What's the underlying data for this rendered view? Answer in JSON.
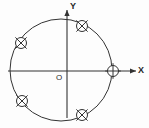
{
  "figure": {
    "type": "geometry-diagram",
    "background_color": "#fdfdfd",
    "stroke_color": "#333333",
    "label_color": "#262626"
  },
  "axes": {
    "origin_label": "O",
    "x_axis": {
      "label": "X",
      "name": "x-axis",
      "from": [
        8,
        71
      ],
      "to": [
        136,
        71
      ],
      "arrow": "right"
    },
    "y_axis": {
      "label": "Y",
      "name": "y-axis",
      "from": [
        67,
        118
      ],
      "to": [
        67,
        10
      ],
      "arrow": "up"
    },
    "origin_point": [
      67,
      71
    ]
  },
  "circle": {
    "name": "main-circle",
    "center": [
      61,
      70
    ],
    "radius": 51,
    "stroke_width": 1
  },
  "markers": [
    {
      "id": "marker-x-axis",
      "name": "circled-plus-marker",
      "glyph": "circle-with-cross",
      "position": [
        113,
        71
      ],
      "radius": 5.5,
      "on_axis": "x",
      "angle_deg": 0
    },
    {
      "id": "marker-upper-right",
      "name": "circled-cross-marker-upper-right",
      "glyph": "circle-with-x",
      "position": [
        82,
        26
      ],
      "radius": 5.5,
      "angle_deg": 61
    },
    {
      "id": "marker-upper-left",
      "name": "circled-cross-marker-upper-left",
      "glyph": "circle-with-x",
      "position": [
        21,
        43
      ],
      "radius": 5.5,
      "angle_deg": 148
    },
    {
      "id": "marker-lower-left",
      "name": "circled-cross-marker-lower-left",
      "glyph": "circle-with-x",
      "position": [
        22,
        101
      ],
      "radius": 5.5,
      "angle_deg": 220
    },
    {
      "id": "marker-lower-right",
      "name": "circled-cross-marker-lower-right",
      "glyph": "circle-with-x",
      "position": [
        82,
        115
      ],
      "radius": 5.5,
      "angle_deg": 297
    }
  ],
  "chart_data": {
    "type": "scatter",
    "xlabel": "X",
    "ylabel": "Y",
    "grid": false,
    "legend": null,
    "annotations": [
      "O",
      "X",
      "Y"
    ],
    "categories": [
      "marker-x-axis",
      "marker-upper-right",
      "marker-upper-left",
      "marker-lower-left",
      "marker-lower-right"
    ],
    "series": [
      {
        "name": "circled-plus",
        "marker": "circle-with-cross",
        "points": [
          {
            "label": "marker-x-axis",
            "angle_deg": 0,
            "x": 1.0,
            "y": 0.0
          }
        ]
      },
      {
        "name": "circled-cross",
        "marker": "circle-with-x",
        "points": [
          {
            "label": "marker-upper-right",
            "angle_deg": 61,
            "x": 0.48,
            "y": 0.87
          },
          {
            "label": "marker-upper-left",
            "angle_deg": 148,
            "x": -0.85,
            "y": 0.53
          },
          {
            "label": "marker-lower-left",
            "angle_deg": 220,
            "x": -0.77,
            "y": -0.64
          },
          {
            "label": "marker-lower-right",
            "angle_deg": 297,
            "x": 0.45,
            "y": -0.89
          }
        ]
      }
    ],
    "xlim": [
      -1.2,
      1.45
    ],
    "ylim": [
      -1.2,
      1.25
    ]
  }
}
